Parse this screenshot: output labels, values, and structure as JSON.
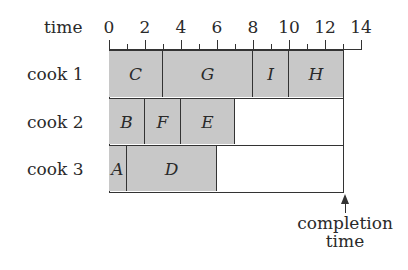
{
  "axis": {
    "label": "time",
    "ticks": [
      "0",
      "2",
      "4",
      "6",
      "8",
      "10",
      "12",
      "14"
    ],
    "unit_px": 18,
    "origin_x": 109,
    "max": 14
  },
  "rows": [
    {
      "label": "cook 1",
      "tasks": [
        {
          "name": "C",
          "start": 0,
          "end": 3
        },
        {
          "name": "G",
          "start": 3,
          "end": 8
        },
        {
          "name": "I",
          "start": 8,
          "end": 10
        },
        {
          "name": "H",
          "start": 10,
          "end": 13
        }
      ]
    },
    {
      "label": "cook 2",
      "tasks": [
        {
          "name": "B",
          "start": 0,
          "end": 2
        },
        {
          "name": "F",
          "start": 2,
          "end": 4
        },
        {
          "name": "E",
          "start": 4,
          "end": 7
        }
      ]
    },
    {
      "label": "cook 3",
      "tasks": [
        {
          "name": "A",
          "start": 0,
          "end": 1
        },
        {
          "name": "D",
          "start": 1,
          "end": 6
        }
      ]
    }
  ],
  "completion": {
    "time": 13,
    "label_line1": "completion",
    "label_line2": "time"
  },
  "colors": {
    "task_fill": "#c8c8c8",
    "line": "#333333"
  },
  "chart_data": {
    "type": "gantt",
    "title": "",
    "xlabel": "time",
    "xlim": [
      0,
      14
    ],
    "xticks": [
      0,
      2,
      4,
      6,
      8,
      10,
      12,
      14
    ],
    "categories": [
      "cook 1",
      "cook 2",
      "cook 3"
    ],
    "series": [
      {
        "name": "cook 1",
        "tasks": [
          [
            "C",
            0,
            3
          ],
          [
            "G",
            3,
            8
          ],
          [
            "I",
            8,
            10
          ],
          [
            "H",
            10,
            13
          ]
        ]
      },
      {
        "name": "cook 2",
        "tasks": [
          [
            "B",
            0,
            2
          ],
          [
            "F",
            2,
            4
          ],
          [
            "E",
            4,
            7
          ]
        ]
      },
      {
        "name": "cook 3",
        "tasks": [
          [
            "A",
            0,
            1
          ],
          [
            "D",
            1,
            6
          ]
        ]
      }
    ],
    "annotations": [
      {
        "text": "completion time",
        "x": 13
      }
    ]
  }
}
